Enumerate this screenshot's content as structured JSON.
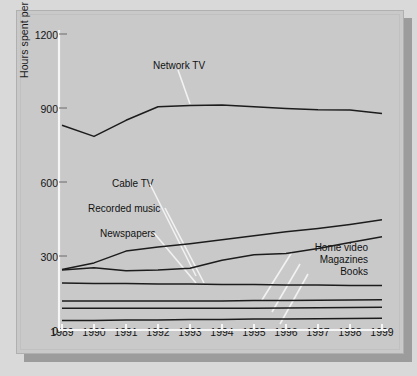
{
  "figure": {
    "background_color": "#d9d9d9",
    "panel_color": "#c9c9c9",
    "shadow_color": "#9c9c9c",
    "line_color": "#1c1c1c",
    "leader_color": "#f2f2f2",
    "axis_color": "#f5f5f5"
  },
  "chart_data": {
    "type": "line",
    "title": "",
    "xlabel": "",
    "ylabel": "Hours spent per person per year",
    "xlim": [
      1989,
      1999
    ],
    "ylim": [
      0,
      1200
    ],
    "yticks": [
      0,
      300,
      600,
      900,
      1200
    ],
    "grid": false,
    "legend": "inline-labels-with-leader-lines",
    "categories": [
      1989,
      1990,
      1991,
      1992,
      1993,
      1994,
      1995,
      1996,
      1997,
      1998,
      1999
    ],
    "x": [
      "1989",
      "1990",
      "1991",
      "1992",
      "1993",
      "1994",
      "1995",
      "1996",
      "1997",
      "1998",
      "1999"
    ],
    "series": [
      {
        "name": "Network TV",
        "values": [
          830,
          785,
          850,
          905,
          910,
          912,
          905,
          898,
          893,
          892,
          878
        ]
      },
      {
        "name": "Cable TV",
        "values": [
          245,
          272,
          320,
          336,
          350,
          366,
          382,
          398,
          412,
          428,
          447
        ]
      },
      {
        "name": "Recorded music",
        "values": [
          243,
          252,
          240,
          243,
          250,
          283,
          305,
          310,
          330,
          355,
          378
        ]
      },
      {
        "name": "Newspapers",
        "values": [
          190,
          189,
          188,
          187,
          186,
          185,
          184,
          183,
          182,
          181,
          180
        ]
      },
      {
        "name": "Home video",
        "values": [
          118,
          118,
          118,
          118,
          118,
          118,
          119,
          120,
          121,
          122,
          123
        ]
      },
      {
        "name": "Magazines",
        "values": [
          88,
          88,
          88,
          88,
          88,
          88,
          88,
          89,
          90,
          91,
          92
        ]
      },
      {
        "name": "Books",
        "values": [
          38,
          39,
          40,
          41,
          42,
          43,
          44,
          45,
          46,
          47,
          48
        ]
      }
    ],
    "tick_labels_y": [
      "0",
      "300",
      "600",
      "900",
      "1200"
    ]
  },
  "annotations": {
    "network_tv": "Network TV",
    "cable_tv": "Cable TV",
    "recorded_music": "Recorded music",
    "newspapers": "Newspapers",
    "home_video": "Home video",
    "magazines": "Magazines",
    "books": "Books"
  },
  "axis": {
    "y_title": "Hours spent per person per year",
    "y_ticks": [
      "1200",
      "900",
      "600",
      "300",
      "0"
    ],
    "x_ticks": [
      "1989",
      "1990",
      "1991",
      "1992",
      "1993",
      "1994",
      "1995",
      "1996",
      "1997",
      "1998",
      "1999"
    ]
  }
}
